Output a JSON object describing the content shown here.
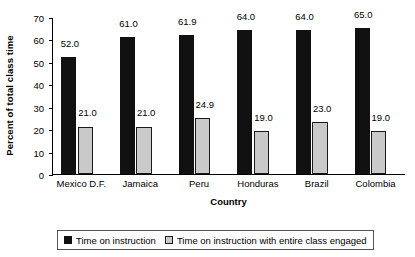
{
  "chart_data": {
    "type": "bar",
    "title": "",
    "xlabel": "Country",
    "ylabel": "Percent of total class time",
    "ylim": [
      0,
      70
    ],
    "ytick_step": 10,
    "yticks": [
      "0",
      "10",
      "20",
      "30",
      "40",
      "50",
      "60",
      "70"
    ],
    "grid": false,
    "legend_position": "bottom",
    "categories": [
      "Mexico D.F.",
      "Jamaica",
      "Peru",
      "Honduras",
      "Brazil",
      "Colombia"
    ],
    "series": [
      {
        "name": "Time on instruction",
        "color": "#111111",
        "values": [
          52.0,
          61.0,
          61.9,
          64.0,
          64.0,
          65.0
        ],
        "labels": [
          "52.0",
          "61.0",
          "61.9",
          "64.0",
          "64.0",
          "65.0"
        ]
      },
      {
        "name": "Time on instruction with entire class engaged",
        "color": "#c9c9c9",
        "values": [
          21.0,
          21.0,
          24.9,
          19.0,
          23.0,
          19.0
        ],
        "labels": [
          "21.0",
          "21.0",
          "24.9",
          "19.0",
          "23.0",
          "19.0"
        ]
      }
    ]
  },
  "legend": {
    "entries": [
      {
        "label": "Time on instruction"
      },
      {
        "label": "Time on instruction with entire class engaged"
      }
    ]
  }
}
